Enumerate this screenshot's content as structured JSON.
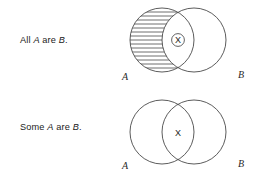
{
  "page": {
    "background_color": "#ffffff",
    "ink_color": "#3d3d3d",
    "width": 258,
    "height": 178
  },
  "diagrams": [
    {
      "id": "all-a-are-b",
      "caption_prefix": "All ",
      "caption_var1": "A",
      "caption_middle": " are ",
      "caption_var2": "B",
      "caption_suffix": ".",
      "caption_text": "All A are B.",
      "left_label": "A",
      "right_label": "B",
      "marker": "X",
      "marker_style": "circled",
      "shading": "left-crescent-hatched",
      "shading_note": "horizontal hatch lines fill the part of circle A outside B"
    },
    {
      "id": "some-a-are-b",
      "caption_prefix": "Some ",
      "caption_var1": "A",
      "caption_middle": " are ",
      "caption_var2": "B",
      "caption_suffix": ".",
      "caption_text": "Some A are B.",
      "left_label": "A",
      "right_label": "B",
      "marker": "X",
      "marker_style": "plain",
      "shading": "none",
      "shading_note": "both circles unshaded"
    }
  ]
}
